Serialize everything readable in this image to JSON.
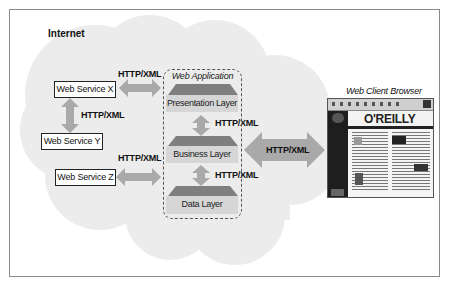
{
  "diagram": {
    "region_label": "Internet",
    "services": [
      {
        "id": "x",
        "label": "Web Service X"
      },
      {
        "id": "y",
        "label": "Web Service Y"
      },
      {
        "id": "z",
        "label": "Web Service Z"
      }
    ],
    "connections": {
      "x_to_app": "HTTP/XML",
      "x_to_y": "HTTP/XML",
      "z_to_app": "HTTP/XML",
      "presentation_to_business": "HTTP/XML",
      "business_to_data": "HTTP/XML",
      "app_to_browser": "HTTP/XML"
    },
    "web_application": {
      "title": "Web Application",
      "layers": [
        "Presentation Layer",
        "Business Layer",
        "Data Layer"
      ]
    },
    "client": {
      "title": "Web Client Browser",
      "screenshot_brand": "O'REILLY"
    },
    "colors": {
      "cloud": "#ececec",
      "arrow": "#a9a9a9",
      "layer_cap": "#7f7f7f",
      "layer_body": "#d6d6d6",
      "frame": "#8a8a8a"
    }
  }
}
